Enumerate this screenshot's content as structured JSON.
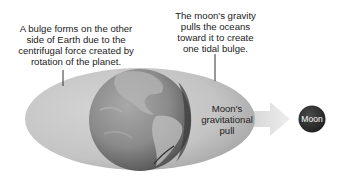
{
  "diagram": {
    "labels": {
      "far_side_bulge": "A bulge forms on the other\nside of Earth due to the\ncentrifugal force created by\nrotation of the planet.",
      "near_side_bulge": "The moon's gravity\npulls the oceans\ntoward it to create\none tidal bulge.",
      "gravitational_pull": "Moon's\ngravitational\npull",
      "moon": "Moon"
    },
    "nodes": [
      {
        "id": "tidal-bulge-ellipse",
        "shape": "ellipse",
        "description": "Ocean water envelope elongated along the Earth-Moon axis"
      },
      {
        "id": "earth",
        "shape": "circle",
        "description": "Earth globe showing the Americas"
      },
      {
        "id": "moon",
        "shape": "circle",
        "label": "Moon"
      }
    ],
    "edges": [
      {
        "from": "earth",
        "to": "moon",
        "type": "arrow",
        "label": "Moon's gravitational pull"
      }
    ],
    "colors": {
      "ellipse_fill": "#c9c9c9",
      "ellipse_edge": "#9a9a9a",
      "earth_dark": "#4a4a4a",
      "earth_light": "#a8a8a8",
      "arrow": "#dedede",
      "moon": "#2e2e2e",
      "text": "#222222",
      "leader_line": "#333333"
    }
  }
}
